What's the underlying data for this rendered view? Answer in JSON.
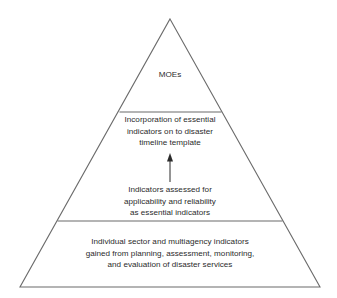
{
  "diagram": {
    "type": "pyramid",
    "shape_name": "triangle-pyramid",
    "levels": 3,
    "stroke_color": "#6b6b6b",
    "text_color": "#2b2b2b",
    "background_color": "#ffffff",
    "tiers": [
      {
        "index": 1,
        "position": "top",
        "text": "MOEs"
      },
      {
        "index": 2,
        "position": "middle",
        "text": "Incorporation of essential\nindicators on to disaster\ntimeline template"
      },
      {
        "index": 3,
        "position": "base",
        "text": "Individual sector and multiagency indicators\ngained from planning, assessment, monitoring,\nand evaluation of disaster services"
      }
    ],
    "annotation": {
      "text": "Indicators assessed for\napplicability and reliability\nas essential indicators",
      "arrow_icon": "arrow-up-icon",
      "arrow_direction": "up"
    }
  }
}
